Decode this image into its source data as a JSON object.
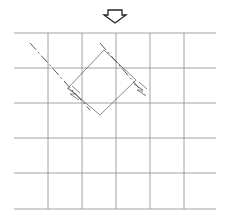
{
  "diagram": {
    "arrow_icon": "down-arrow-icon",
    "grid": {
      "rows": 5,
      "columns": 6
    },
    "colors": {
      "grid": "#8a8a8a",
      "lines": "#444444",
      "background": "#ffffff"
    }
  }
}
